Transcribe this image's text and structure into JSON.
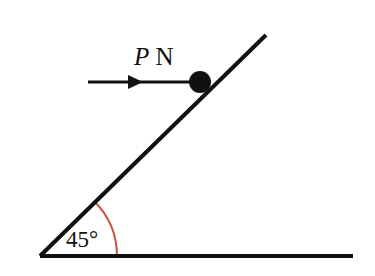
{
  "figure": {
    "background_color": "#ffffff",
    "line_color": "#111111",
    "arc_color": "#c6563f"
  },
  "incline": {
    "name": "inclined-surface",
    "angle_degrees": 45,
    "vertex": {
      "x": 40,
      "y": 256
    },
    "top_end": {
      "x": 266,
      "y": 35
    },
    "stroke_width": 4
  },
  "ground": {
    "name": "horizontal-ground-line",
    "start": {
      "x": 40,
      "y": 256
    },
    "end": {
      "x": 353,
      "y": 256
    },
    "stroke_width": 4
  },
  "angle_marker": {
    "label": "45°",
    "value": 45,
    "unit": "degrees",
    "color": "#c6563f",
    "radius": 77,
    "label_x": 66,
    "label_y": 247
  },
  "block": {
    "name": "particle-block",
    "shape": "filled-circle",
    "center": {
      "x": 200,
      "y": 82
    },
    "radius": 11,
    "color": "#111111"
  },
  "force_arrow": {
    "label": "P N",
    "label_parts": {
      "magnitude": "P",
      "unit": "N"
    },
    "direction": "horizontal-right",
    "tail": {
      "x": 88,
      "y": 82
    },
    "head_tip": {
      "x": 143,
      "y": 82
    },
    "shaft_end": {
      "x": 192,
      "y": 82
    },
    "stroke_width": 3,
    "label_x": 134,
    "label_y": 65
  }
}
